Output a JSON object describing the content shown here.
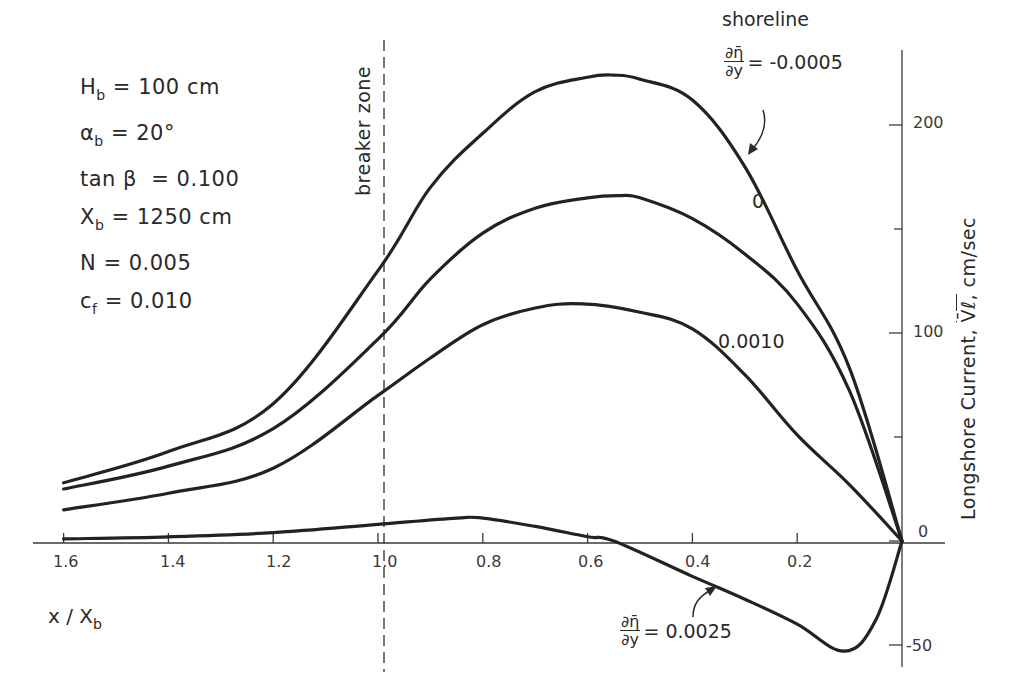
{
  "chart_data": {
    "type": "line",
    "title": "",
    "xlabel": "x / X_b",
    "ylabel": "Longshore Current, V̄ℓ, cm/sec",
    "xlim": [
      1.6,
      0.0
    ],
    "ylim": [
      -50,
      200
    ],
    "x_axis_reversed": true,
    "x_ticks": [
      "1.6",
      "1.4",
      "1.2",
      "1.0",
      "0.8",
      "0.6",
      "0.4",
      "0.2"
    ],
    "y_ticks": [
      "200",
      "100",
      "0",
      "-50"
    ],
    "y_minor_ticks": [
      150,
      50
    ],
    "grid": false,
    "y_axis_position": "right",
    "annotations": {
      "shoreline": "shoreline",
      "breaker_zone": "breaker zone",
      "breaker_x": 1.0
    },
    "parameters": [
      {
        "symbol": "H",
        "sub": "b",
        "value": "= 100 cm"
      },
      {
        "symbol": "α",
        "sub": "b",
        "value": "= 20°"
      },
      {
        "symbol": "tan β",
        "sub": "",
        "value": "= 0.100"
      },
      {
        "symbol": "X",
        "sub": "b",
        "value": "= 1250 cm"
      },
      {
        "symbol": "N",
        "sub": "",
        "value": "= 0.005"
      },
      {
        "symbol": "c",
        "sub": "f",
        "value": "= 0.010"
      }
    ],
    "series": [
      {
        "name": "∂η̄/∂y = -0.0005",
        "label": "= -0.0005",
        "x": [
          1.6,
          1.4,
          1.2,
          1.0,
          0.9,
          0.8,
          0.7,
          0.6,
          0.55,
          0.5,
          0.4,
          0.3,
          0.2,
          0.1,
          0.0
        ],
        "values": [
          28,
          43,
          66,
          130,
          170,
          196,
          216,
          223,
          224,
          222,
          212,
          180,
          130,
          83,
          0
        ]
      },
      {
        "name": "∂η̄/∂y = 0",
        "label": "0",
        "x": [
          1.6,
          1.4,
          1.2,
          1.0,
          0.9,
          0.8,
          0.7,
          0.6,
          0.54,
          0.5,
          0.4,
          0.3,
          0.2,
          0.1,
          0.0
        ],
        "values": [
          25,
          36,
          54,
          97,
          126,
          148,
          160,
          165,
          166,
          165,
          155,
          138,
          114,
          72,
          0
        ]
      },
      {
        "name": "∂η̄/∂y = 0.0010",
        "label": "0.0010",
        "x": [
          1.6,
          1.4,
          1.2,
          1.0,
          0.9,
          0.8,
          0.7,
          0.61,
          0.5,
          0.4,
          0.3,
          0.2,
          0.1,
          0.0
        ],
        "values": [
          15,
          23,
          35,
          70,
          88,
          104,
          112,
          114,
          110,
          102,
          80,
          51,
          27,
          0
        ]
      },
      {
        "name": "∂η̄/∂y = 0.0025",
        "label": "= 0.0025",
        "x": [
          1.6,
          1.4,
          1.2,
          1.0,
          0.85,
          0.8,
          0.7,
          0.6,
          0.55,
          0.4,
          0.3,
          0.2,
          0.11,
          0.05,
          0.0
        ],
        "values": [
          1,
          2,
          4,
          8,
          11,
          11,
          7,
          2,
          0,
          -17,
          -28,
          -40,
          -53,
          -38,
          0
        ]
      }
    ]
  },
  "text": {
    "shoreline": "shoreline",
    "breaker_zone": "breaker zone",
    "label_top_eq": "= -0.0005",
    "label_zero": "0",
    "label_0010": "0.0010",
    "label_bottom_eq": "= 0.0025",
    "frac_num": "∂η̄",
    "frac_den": "∂y",
    "y_axis_title": "Longshore Current,",
    "y_axis_symbol": "V̄ℓ,",
    "y_axis_unit": "cm/sec",
    "x_axis_title": "x / X",
    "x_axis_sub": "b",
    "p0_sym": "H",
    "p0_sub": "b",
    "p0_val": " = 100 cm",
    "p1_sym": "α",
    "p1_sub": "b",
    "p1_val": " = 20°",
    "p2_sym": "tan β",
    "p2_val": "  = 0.100",
    "p3_sym": "X",
    "p3_sub": "b",
    "p3_val": " = 1250 cm",
    "p4_sym": "N",
    "p4_val": " = 0.005",
    "p5_sym": "c",
    "p5_sub": "f",
    "p5_val": " = 0.010",
    "xt0": "1.6",
    "xt1": "1.4",
    "xt2": "1.2",
    "xt3": "1.0",
    "xt4": "0.8",
    "xt5": "0.6",
    "xt6": "0.4",
    "xt7": "0.2",
    "yt200": "200",
    "yt100": "100",
    "yt0": "0",
    "ytm50": "-50"
  },
  "colors": {
    "ink": "#2a2a2a",
    "background": "#ffffff"
  }
}
